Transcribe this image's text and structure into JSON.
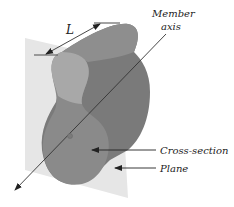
{
  "diagram": {
    "labels": {
      "length": "L",
      "member_axis_line1": "Member",
      "member_axis_line2": "axis",
      "cross_section": "Cross-section",
      "plane": "Plane"
    },
    "colors": {
      "background": "#ffffff",
      "plane": "#e6e6e6",
      "member_dark": "#7a7a7a",
      "member_mid": "#8e8e8e",
      "cross_section": "#8a8a8a",
      "cross_section_light": "#a8a8a8",
      "axis_line": "#333333",
      "text": "#222222"
    }
  }
}
